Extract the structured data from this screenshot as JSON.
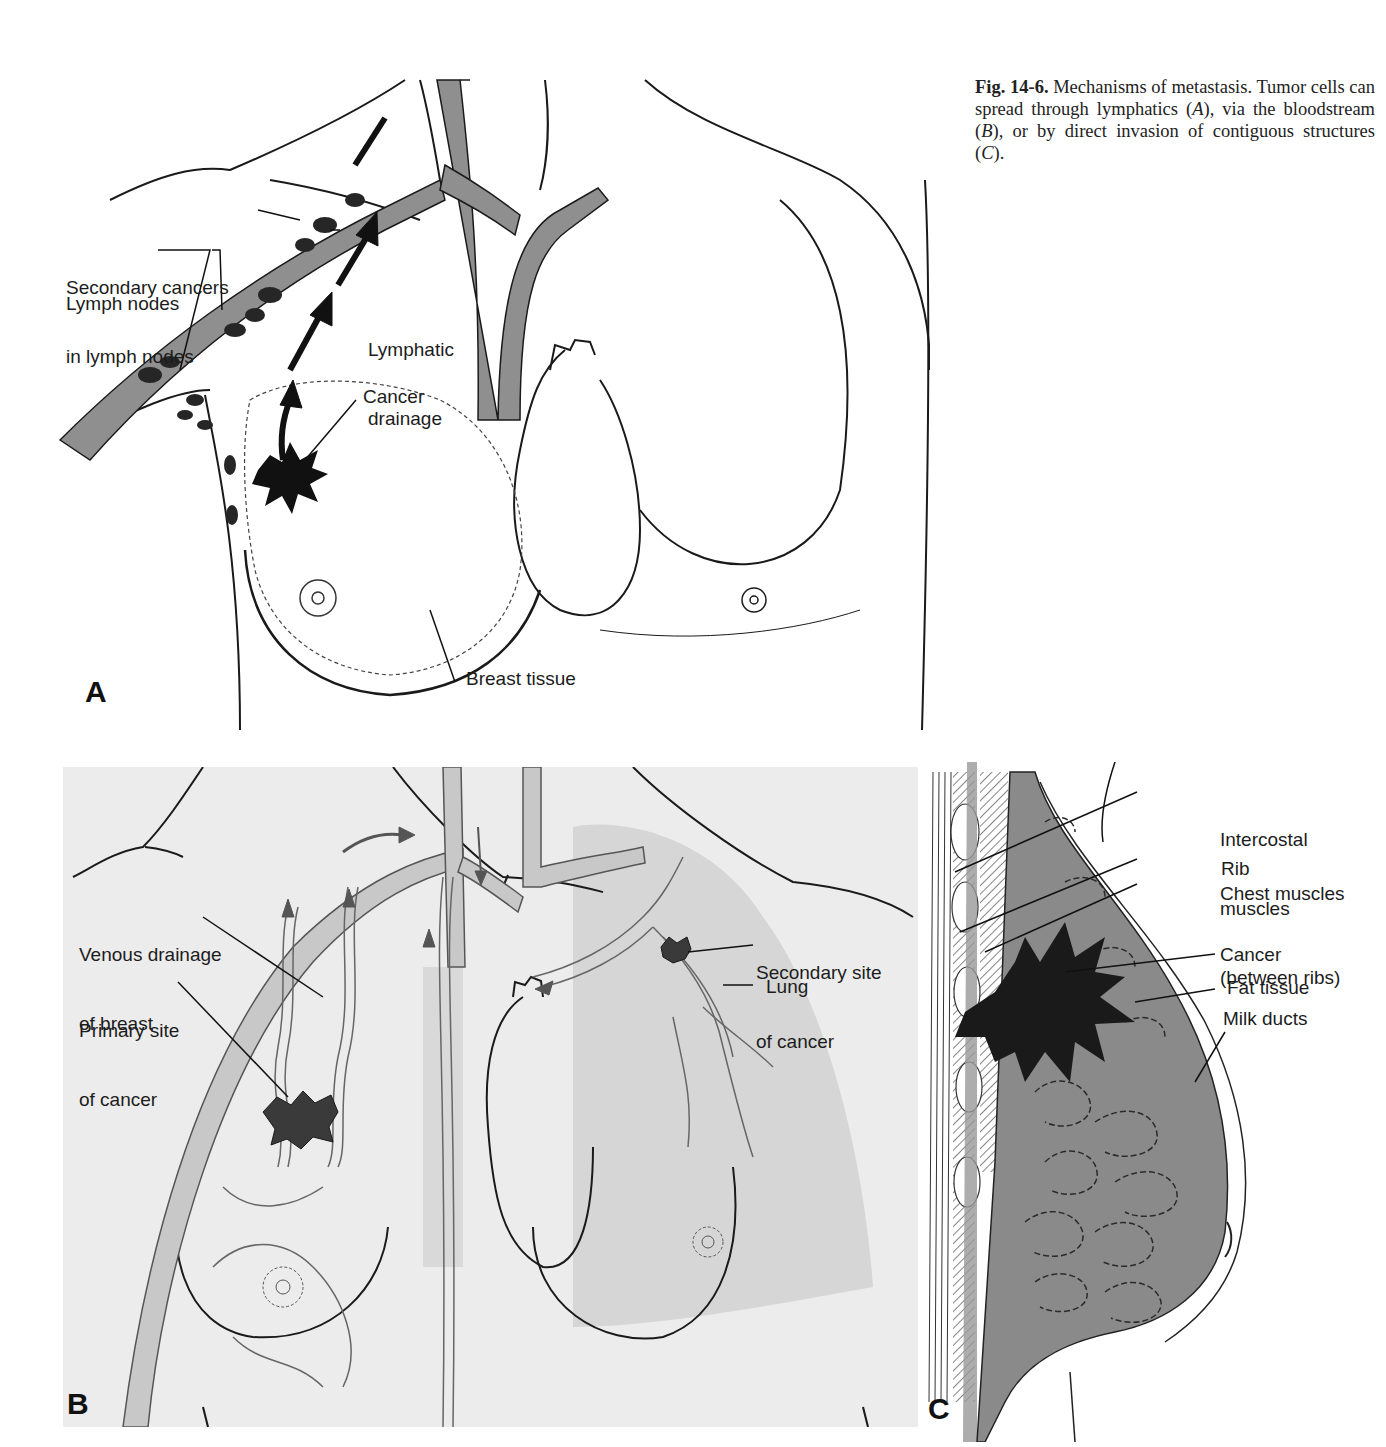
{
  "caption": {
    "fig_number": "Fig. 14-6.",
    "text_1": " Mechanisms of metastasis. Tumor cells can spread through lymphatics (",
    "ref_a": "A",
    "text_2": "), via the bloodstream (",
    "ref_b": "B",
    "text_3": "), or by direct invasion of contiguous structures (",
    "ref_c": "C",
    "text_4": ")."
  },
  "panel_a": {
    "letter": "A",
    "mechanism": "lymphatic spread",
    "labels": {
      "secondary_cancers_1": "Secondary cancers",
      "secondary_cancers_2": "in lymph nodes",
      "lymph_nodes": "Lymph nodes",
      "lymphatic_1": "Lymphatic",
      "lymphatic_2": "drainage",
      "cancer": "Cancer",
      "breast_tissue": "Breast tissue"
    }
  },
  "panel_b": {
    "letter": "B",
    "mechanism": "bloodstream spread",
    "labels": {
      "venous_1": "Venous drainage",
      "venous_2": "of breast",
      "primary_1": "Primary site",
      "primary_2": "of cancer",
      "secondary_1": "Secondary site",
      "secondary_2": "of cancer",
      "lung": "Lung"
    }
  },
  "panel_c": {
    "letter": "C",
    "mechanism": "direct invasion",
    "labels": {
      "intercostal_1": "Intercostal",
      "intercostal_2": "muscles",
      "intercostal_3": "(between ribs)",
      "rib": "Rib",
      "chest_muscles": "Chest muscles",
      "cancer": "Cancer",
      "fat_tissue": "Fat tissue",
      "milk_ducts": "Milk ducts"
    }
  },
  "colors": {
    "vessel_gray": "#8f8f8f",
    "panel_b_bg": "#ececec",
    "lung_shade": "#d6d6d6",
    "tumor": "#1e1e1e",
    "breast_tissue_c": "#8a8a8a"
  }
}
